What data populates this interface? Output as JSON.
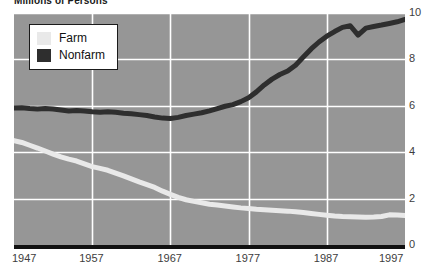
{
  "chart_data": {
    "type": "line",
    "title": "Millions of Persons",
    "xlabel": "",
    "ylabel": "",
    "xlim": [
      1947,
      1997
    ],
    "ylim": [
      0,
      10
    ],
    "grid": true,
    "background_color": "#969696",
    "gridline_color": "#ffffff",
    "legend_position": "top-left",
    "xticks": [
      "1947",
      "1957",
      "1967",
      "1977",
      "1987",
      "1997"
    ],
    "xtick_values": [
      1947,
      1957,
      1967,
      1977,
      1987,
      1997
    ],
    "yticks": [
      "0",
      "2",
      "4",
      "6",
      "8",
      "10"
    ],
    "ytick_values": [
      0,
      2,
      4,
      6,
      8,
      10
    ],
    "yaxis_side": "right",
    "x": [
      1947,
      1948,
      1949,
      1950,
      1951,
      1952,
      1953,
      1954,
      1955,
      1956,
      1957,
      1958,
      1959,
      1960,
      1961,
      1962,
      1963,
      1964,
      1965,
      1966,
      1967,
      1968,
      1969,
      1970,
      1971,
      1972,
      1973,
      1974,
      1975,
      1976,
      1977,
      1978,
      1979,
      1980,
      1981,
      1982,
      1983,
      1984,
      1985,
      1986,
      1987,
      1988,
      1989,
      1990,
      1991,
      1992,
      1993,
      1994,
      1995,
      1996,
      1997
    ],
    "series": [
      {
        "name": "Farm",
        "color": "#e9e9e9",
        "values": [
          4.5,
          4.42,
          4.3,
          4.18,
          4.05,
          3.92,
          3.8,
          3.7,
          3.62,
          3.5,
          3.38,
          3.3,
          3.22,
          3.1,
          2.98,
          2.85,
          2.72,
          2.6,
          2.48,
          2.32,
          2.18,
          2.05,
          1.95,
          1.88,
          1.82,
          1.76,
          1.72,
          1.68,
          1.64,
          1.6,
          1.57,
          1.54,
          1.52,
          1.5,
          1.48,
          1.46,
          1.43,
          1.4,
          1.36,
          1.32,
          1.28,
          1.25,
          1.23,
          1.22,
          1.21,
          1.2,
          1.21,
          1.23,
          1.3,
          1.29,
          1.27
        ]
      },
      {
        "name": "Nonfarm",
        "color": "#2e2e2e",
        "values": [
          5.9,
          5.92,
          5.88,
          5.86,
          5.88,
          5.86,
          5.82,
          5.78,
          5.8,
          5.78,
          5.74,
          5.72,
          5.74,
          5.72,
          5.68,
          5.66,
          5.62,
          5.58,
          5.52,
          5.47,
          5.45,
          5.5,
          5.58,
          5.64,
          5.7,
          5.78,
          5.88,
          5.98,
          6.05,
          6.18,
          6.35,
          6.6,
          6.9,
          7.15,
          7.35,
          7.5,
          7.75,
          8.1,
          8.45,
          8.75,
          9.0,
          9.2,
          9.38,
          9.45,
          9.05,
          9.35,
          9.42,
          9.48,
          9.55,
          9.62,
          9.72
        ]
      }
    ]
  },
  "legend": {
    "items": [
      {
        "label": "Farm",
        "color": "#e9e9e9"
      },
      {
        "label": "Nonfarm",
        "color": "#2e2e2e"
      }
    ]
  }
}
